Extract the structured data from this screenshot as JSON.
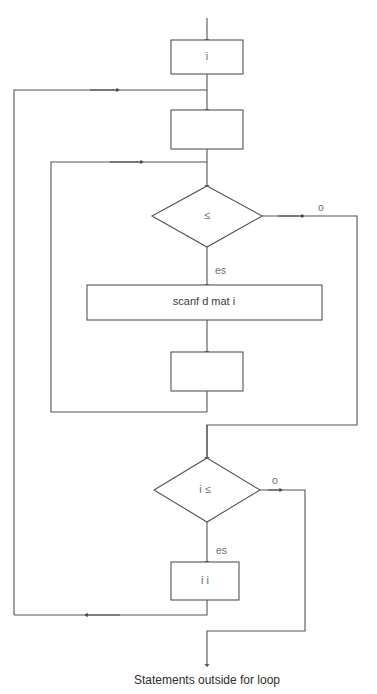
{
  "diagram": {
    "caption": "Statements outside for loop",
    "colors": {
      "stroke": "#555555",
      "background": "#ffffff",
      "node_text": "#6b6b6b",
      "caption_text": "#2e2e2e",
      "edge_label": "#6f6f6f"
    },
    "nodes": [
      {
        "id": "init",
        "type": "process",
        "label": "i"
      },
      {
        "id": "block2",
        "type": "process",
        "label": ""
      },
      {
        "id": "cond1",
        "type": "decision",
        "label": "≤"
      },
      {
        "id": "scanf",
        "type": "process",
        "label": "scanf    d     mat i"
      },
      {
        "id": "block4",
        "type": "process",
        "label": ""
      },
      {
        "id": "cond2",
        "type": "decision",
        "label": "i ≤"
      },
      {
        "id": "increment",
        "type": "process",
        "label": "i    i"
      }
    ],
    "edge_labels": {
      "cond1_no": "o",
      "cond1_yes": "es",
      "cond2_no": "o",
      "cond2_yes": "es"
    }
  }
}
